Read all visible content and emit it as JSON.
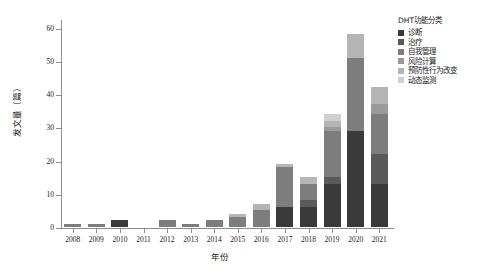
{
  "chart_data": {
    "type": "bar",
    "stacked": true,
    "title": "",
    "xlabel": "年份",
    "ylabel": "发文量（篇）",
    "ylim": [
      0,
      62
    ],
    "yticks": [
      0,
      10,
      20,
      30,
      40,
      50,
      60
    ],
    "ytick_labels": [
      "0",
      "10",
      "20",
      "30",
      "40",
      "50",
      "60"
    ],
    "grid": false,
    "legend_position": "top-right",
    "legend_title": "DHT功能分类",
    "categories": [
      "2008",
      "2009",
      "2010",
      "2011",
      "2012",
      "2013",
      "2014",
      "2015",
      "2016",
      "2017",
      "2018",
      "2019",
      "2020",
      "2021"
    ],
    "series": [
      {
        "name": "诊断",
        "color": "#3a3a3a",
        "values": [
          0,
          0,
          2,
          0,
          0,
          0,
          0,
          0,
          0,
          6,
          6,
          13,
          29,
          13
        ]
      },
      {
        "name": "治疗",
        "color": "#5a5a5a",
        "values": [
          0,
          0,
          0,
          0,
          0,
          0,
          0,
          0,
          0,
          0,
          2,
          2,
          0,
          9
        ]
      },
      {
        "name": "自我管理",
        "color": "#7d7d7d",
        "values": [
          1,
          1,
          0,
          0,
          2,
          1,
          2,
          3,
          5,
          12,
          5,
          14,
          22,
          12
        ]
      },
      {
        "name": "风险计算",
        "color": "#9a9a9a",
        "values": [
          0,
          0,
          0,
          0,
          0,
          0,
          0,
          0,
          0,
          0,
          0,
          1,
          0,
          3
        ]
      },
      {
        "name": "预防性行为改变",
        "color": "#b5b5b5",
        "values": [
          0,
          0,
          0,
          0,
          0,
          0,
          0,
          1,
          2,
          1,
          2,
          2,
          7,
          5
        ]
      },
      {
        "name": "动态监测",
        "color": "#cfcfcf",
        "values": [
          0,
          0,
          0,
          0,
          0,
          0,
          0,
          0,
          0,
          0,
          0,
          2,
          0,
          0
        ]
      }
    ],
    "totals": [
      1,
      1,
      2,
      0,
      2,
      1,
      2,
      4,
      7,
      19,
      15,
      34,
      58,
      42
    ]
  }
}
